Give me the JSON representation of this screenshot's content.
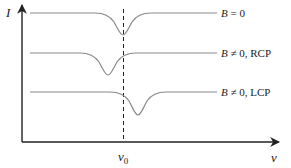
{
  "diagram": {
    "y_axis_label": "I",
    "x_axis_label": "ν",
    "center_marker_label": "ν",
    "center_marker_subscript": "0",
    "curves": [
      {
        "id": "b-zero",
        "label_var": "B",
        "label_rel": " = 0",
        "label_suffix": "",
        "dip_position": "at ν0"
      },
      {
        "id": "rcp",
        "label_var": "B",
        "label_rel": " ≠ 0,",
        "label_suffix": " RCP",
        "dip_position": "below ν0"
      },
      {
        "id": "lcp",
        "label_var": "B",
        "label_rel": " ≠ 0,",
        "label_suffix": " LCP",
        "dip_position": "above ν0"
      }
    ],
    "colors": {
      "axis": "#222222",
      "curve": "#8a8a8a",
      "background": "#ffffff"
    }
  }
}
